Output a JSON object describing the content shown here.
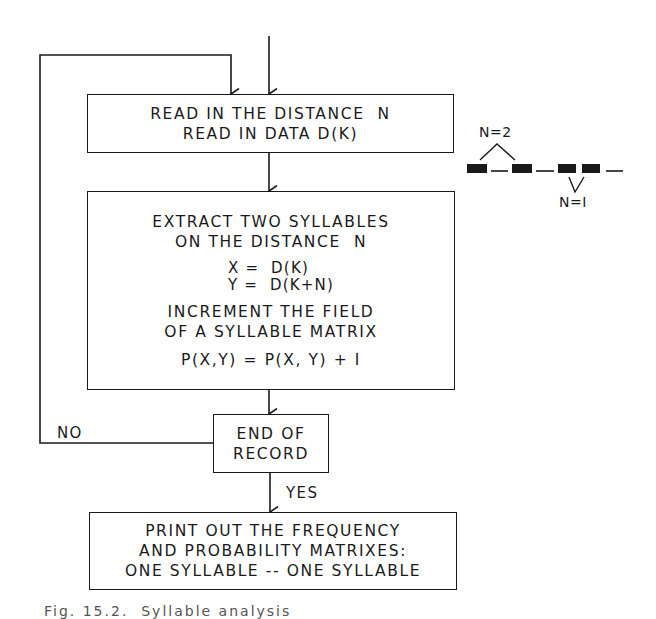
{
  "flowchart": {
    "read_box": {
      "lines": [
        "READ IN THE DISTANCE  N",
        "READ IN DATA D(K)"
      ]
    },
    "extract_box": {
      "heading": [
        "EXTRACT TWO SYLLABLES",
        "ON THE DISTANCE  N"
      ],
      "equations": [
        "X =  D(K)",
        "Y =  D(K+N)"
      ],
      "increment": [
        "INCREMENT THE FIELD",
        "OF A SYLLABLE MATRIX"
      ],
      "formula": "P(X,Y) = P(X, Y) + I"
    },
    "decision_box": {
      "lines": [
        "END OF",
        "RECORD"
      ]
    },
    "branch_labels": {
      "no": "NO",
      "yes": "YES"
    },
    "print_box": {
      "lines": [
        "PRINT OUT THE FREQUENCY",
        "AND PROBABILITY MATRIXES:",
        "ONE SYLLABLE -- ONE SYLLABLE"
      ]
    }
  },
  "side_illustration": {
    "label_top": "N=2",
    "label_bottom": "N=I"
  },
  "caption": "Fig. 15.2.  Syllable analysis"
}
